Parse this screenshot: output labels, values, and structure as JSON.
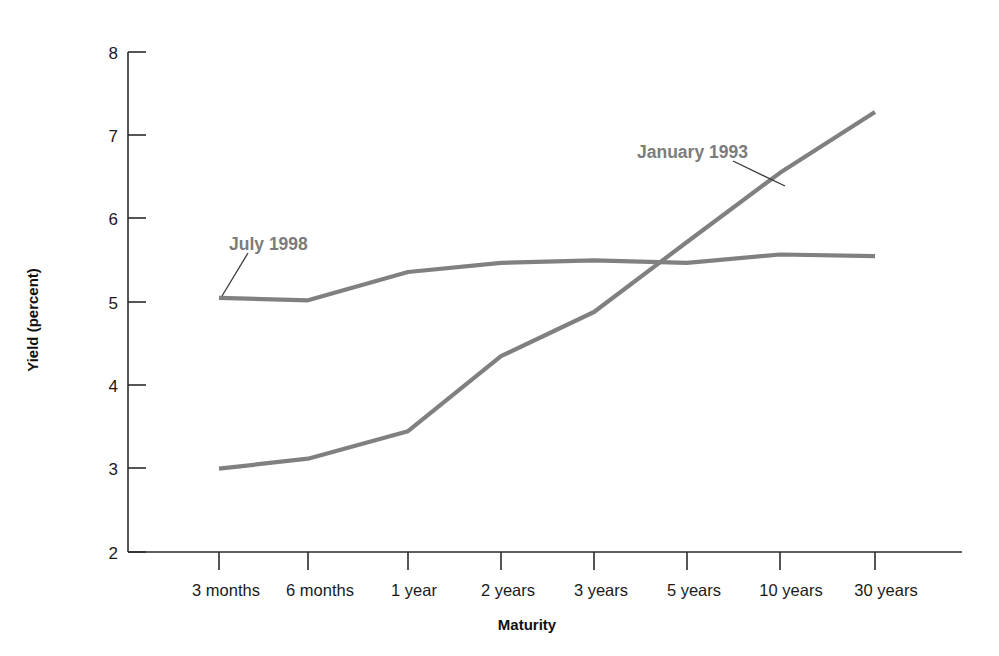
{
  "chart_data": {
    "type": "line",
    "title": "",
    "subtitle": "",
    "xlabel": "Maturity",
    "ylabel": "Yield (percent)",
    "categories": [
      "3 months",
      "6 months",
      "1 year",
      "2 years",
      "3 years",
      "5 years",
      "10 years",
      "30 years"
    ],
    "ylim": [
      2,
      8
    ],
    "yticks": [
      2,
      3,
      4,
      5,
      6,
      7,
      8
    ],
    "ytick_labels": [
      "2",
      "3",
      "4",
      "5",
      "6",
      "7",
      "8"
    ],
    "grid": false,
    "legend": "inline annotations on curves",
    "series": [
      {
        "name": "January 1993",
        "color": "#808080",
        "values": [
          3.0,
          3.12,
          3.45,
          4.35,
          4.88,
          5.72,
          6.55,
          7.28
        ],
        "annotation": {
          "label": "January 1993",
          "anchor_category": "5 years",
          "anchor_value": 6.4
        }
      },
      {
        "name": "July 1998",
        "color": "#808080",
        "values": [
          5.05,
          5.02,
          5.36,
          5.47,
          5.5,
          5.47,
          5.57,
          5.55
        ],
        "annotation": {
          "label": "July 1998",
          "anchor_category": "3 months",
          "anchor_value": 5.04
        }
      }
    ]
  },
  "axes": {
    "y_title": "Yield (percent)",
    "x_title": "Maturity",
    "y_tick_labels": [
      "8",
      "7",
      "6",
      "5",
      "4",
      "3",
      "2"
    ],
    "x_tick_labels": [
      "3 months",
      "6 months",
      "1 year",
      "2 years",
      "3 years",
      "5 years",
      "10 years",
      "30 years"
    ]
  },
  "annotations": {
    "january_1993": "January 1993",
    "july_1998": "July 1998"
  },
  "colors": {
    "series_line": "#808080",
    "axis": "#2b2b2b",
    "annotation_text": "#7c7c7c",
    "tick_text": "#1a1a1a",
    "background": "#ffffff"
  }
}
